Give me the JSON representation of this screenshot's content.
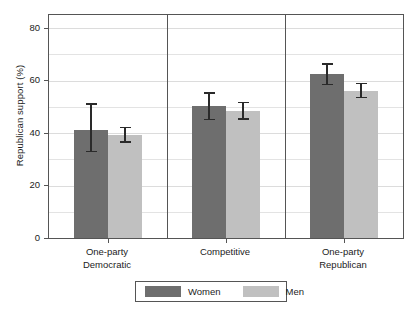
{
  "chart_data": {
    "type": "bar",
    "title": "",
    "subtitle": "",
    "xlabel": "",
    "ylabel": "Republican support (%)",
    "ylim": [
      0,
      85
    ],
    "yticks": [
      0,
      20,
      40,
      60,
      80
    ],
    "ytick_labels": [
      "0",
      "20",
      "40",
      "60",
      "80"
    ],
    "minor_gridlines": [
      10,
      30,
      50,
      70
    ],
    "grid": true,
    "grid_axis": "y",
    "categories": [
      "One-party\nDemocratic",
      "Competitive",
      "One-party\nRepublican"
    ],
    "category_labels_flat": [
      "One-party Democratic",
      "Competitive",
      "One-party Republican"
    ],
    "group_dividers": true,
    "legend_position": "bottom",
    "error_bar_type": "95% confidence interval",
    "series": [
      {
        "name": "Women",
        "color": "#6e6e6e",
        "values": [
          41.0,
          50.2,
          62.4
        ],
        "err_low": [
          33.0,
          45.2,
          58.6
        ],
        "err_high": [
          51.0,
          55.2,
          66.4
        ]
      },
      {
        "name": "Men",
        "color": "#c0c0c0",
        "values": [
          39.4,
          48.4,
          56.2
        ],
        "err_low": [
          36.6,
          45.4,
          53.6
        ],
        "err_high": [
          42.2,
          51.6,
          58.8
        ]
      }
    ]
  },
  "legend": {
    "entries": [
      {
        "label": "Women",
        "color": "#6e6e6e"
      },
      {
        "label": "Men",
        "color": "#c0c0c0"
      }
    ]
  },
  "axis": {
    "y_title": "Republican support (%)"
  }
}
